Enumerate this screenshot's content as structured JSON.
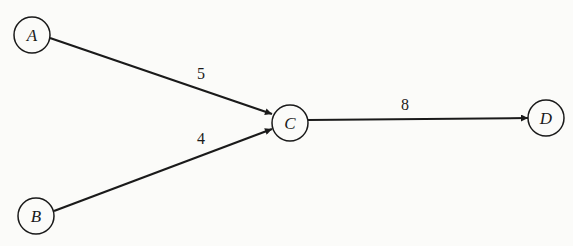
{
  "diagram": {
    "type": "directed-weighted-graph",
    "nodes": [
      {
        "id": "A",
        "label": "A",
        "x": 32,
        "y": 35
      },
      {
        "id": "B",
        "label": "B",
        "x": 36,
        "y": 216
      },
      {
        "id": "C",
        "label": "C",
        "x": 290,
        "y": 124
      },
      {
        "id": "D",
        "label": "D",
        "x": 546,
        "y": 119
      }
    ],
    "edges": [
      {
        "from": "A",
        "to": "C",
        "weight": "5"
      },
      {
        "from": "B",
        "to": "C",
        "weight": "4"
      },
      {
        "from": "C",
        "to": "D",
        "weight": "8"
      }
    ]
  },
  "colors": {
    "ink": "#1a1a1a",
    "background": "#fbfbf9"
  }
}
